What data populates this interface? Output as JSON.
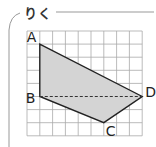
{
  "header": {
    "title": "りく"
  },
  "diagram": {
    "type": "quadrilateral-on-grid",
    "grid": {
      "columns": 9,
      "rows": 8,
      "cell_px": 12.8
    },
    "vertices": [
      {
        "label": "A",
        "col": 1,
        "row": 1
      },
      {
        "label": "B",
        "col": 1,
        "row": 5
      },
      {
        "label": "C",
        "col": 6,
        "row": 7
      },
      {
        "label": "D",
        "col": 9,
        "row": 5
      }
    ],
    "dashed_segment": [
      "B",
      "D"
    ],
    "fill_color": "#d4d4d4",
    "stroke_color": "#222222",
    "grid_color": "#aaaaaa"
  }
}
